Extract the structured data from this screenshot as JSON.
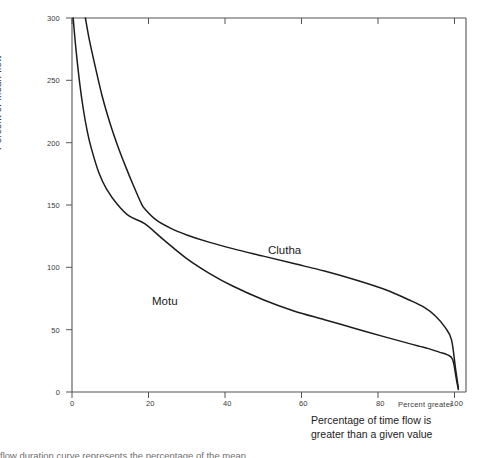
{
  "figure": {
    "background": "#ffffff",
    "axis_color": "#555555",
    "curve_color": "#1c1c1c"
  },
  "chart_data": {
    "type": "line",
    "title": "",
    "xlabel": "Percentage of time flow is greater than a given value",
    "xlabel_line1": "Percentage of time flow is",
    "xlabel_line2": "greater than a given value",
    "secondary_xlabel": "Percent greater",
    "ylabel": "Percent of  mean flow",
    "xlim": [
      0,
      103
    ],
    "ylim": [
      0,
      300
    ],
    "xticks": [
      0,
      20,
      40,
      60,
      80,
      100
    ],
    "yticks": [
      0,
      50,
      100,
      150,
      200,
      250,
      300
    ],
    "xtick_labels": [
      "0",
      "20",
      "40",
      "60",
      "80",
      "100"
    ],
    "ytick_labels": [
      "0",
      "50",
      "100",
      "150",
      "200",
      "250",
      "300"
    ],
    "grid": false,
    "legend_position": "inline-annotation",
    "frame": "box",
    "annotations": [
      {
        "text": "Clutha",
        "x": 50,
        "y": 117
      },
      {
        "text": "Motu",
        "x": 21,
        "y": 76
      }
    ],
    "series": [
      {
        "name": "Motu",
        "label": "Motu",
        "description": "Flashy river flow duration curve, steep decline",
        "x": [
          0.3,
          1,
          2,
          3,
          4,
          5,
          7,
          9,
          12,
          15,
          19,
          24,
          30,
          36,
          42,
          50,
          58,
          66,
          74,
          82,
          88,
          93,
          96,
          98,
          99.5,
          100.5,
          101
        ],
        "y": [
          300,
          276,
          248,
          226,
          209,
          196,
          176,
          163,
          150,
          141,
          135,
          122,
          107,
          95,
          85,
          74,
          65,
          58,
          51,
          44,
          39,
          35,
          32,
          30,
          26,
          10,
          2
        ]
      },
      {
        "name": "Clutha",
        "label": "Clutha",
        "description": "Lake-buffered river flow duration curve, flatter decline",
        "x": [
          3.5,
          4.5,
          6,
          8,
          10,
          12,
          14,
          16,
          18,
          19,
          22,
          26,
          30,
          36,
          42,
          50,
          58,
          66,
          74,
          82,
          88,
          92,
          95,
          97.5,
          99.2,
          100.3,
          101
        ],
        "y": [
          300,
          283,
          262,
          236,
          215,
          197,
          181,
          166,
          152,
          147,
          138,
          131,
          126,
          120,
          115,
          109,
          103,
          97,
          90,
          82,
          74,
          68,
          61,
          52,
          42,
          18,
          3
        ]
      }
    ]
  },
  "caption": {
    "text": "flow duration curve represents the percentage of the mean"
  }
}
